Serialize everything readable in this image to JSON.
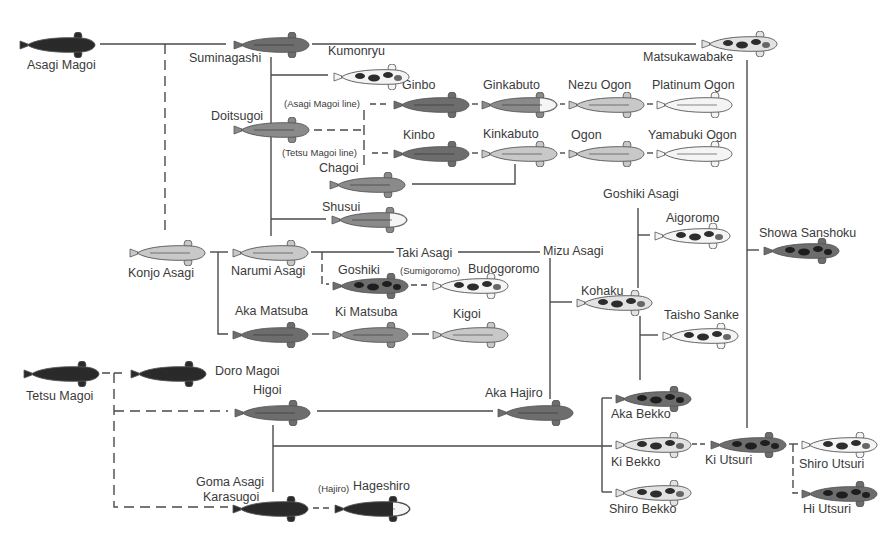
{
  "diagram": {
    "palette": {
      "line": "#444444",
      "dark": "#2a2a2a",
      "grey": "#6d6d6d",
      "mid": "#8a8a8a",
      "light": "#c8c8c8",
      "white": "#f4f4f4",
      "outline": "#555555"
    },
    "nodes": [
      {
        "id": "asagi_magoi",
        "label": "Asagi Magoi",
        "fish": {
          "x": 18,
          "y": 32,
          "style": "dark"
        },
        "label_pos": {
          "x": 27,
          "y": 58
        }
      },
      {
        "id": "suminagashi",
        "label": "Suminagashi",
        "fish": {
          "x": 232,
          "y": 32,
          "style": "grey"
        },
        "label_pos": {
          "x": 189,
          "y": 51
        }
      },
      {
        "id": "kumonryu",
        "label": "Kumonryu",
        "fish": {
          "x": 332,
          "y": 64,
          "style": "spotted"
        },
        "label_pos": {
          "x": 328,
          "y": 44
        }
      },
      {
        "id": "matsukawabake",
        "label": "Matsukawabake",
        "fish": {
          "x": 700,
          "y": 31,
          "style": "spotted-light"
        },
        "label_pos": {
          "x": 643,
          "y": 50
        }
      },
      {
        "id": "doitsugoi",
        "label": "Doitsugoi",
        "fish": {
          "x": 232,
          "y": 117,
          "style": "mid"
        },
        "label_pos": {
          "x": 211,
          "y": 109
        }
      },
      {
        "id": "ginbo",
        "label": "Ginbo",
        "fish": {
          "x": 392,
          "y": 92,
          "style": "grey"
        },
        "label_pos": {
          "x": 402,
          "y": 24
        }
      },
      {
        "id": "ginkabuto",
        "label": "Ginkabuto",
        "fish": {
          "x": 480,
          "y": 92,
          "style": "mid-whitehead"
        },
        "label_pos": {
          "x": 483,
          "y": 24
        }
      },
      {
        "id": "nezu_ogon",
        "label": "Nezu Ogon",
        "fish": {
          "x": 567,
          "y": 92,
          "style": "light"
        },
        "label_pos": {
          "x": 568,
          "y": 24
        }
      },
      {
        "id": "platinum_ogon",
        "label": "Platinum Ogon",
        "fish": {
          "x": 655,
          "y": 92,
          "style": "white"
        },
        "label_pos": {
          "x": 652,
          "y": 24
        }
      },
      {
        "id": "kinbo",
        "label": "Kinbo",
        "fish": {
          "x": 392,
          "y": 141,
          "style": "grey"
        },
        "label_pos": {
          "x": 403,
          "y": 73
        }
      },
      {
        "id": "kinkabuto",
        "label": "Kinkabuto",
        "fish": {
          "x": 480,
          "y": 141,
          "style": "light"
        },
        "label_pos": {
          "x": 483,
          "y": 73
        }
      },
      {
        "id": "ogon",
        "label": "Ogon",
        "fish": {
          "x": 567,
          "y": 141,
          "style": "light"
        },
        "label_pos": {
          "x": 571,
          "y": 73
        }
      },
      {
        "id": "yamabuki_ogon",
        "label": "Yamabuki Ogon",
        "fish": {
          "x": 655,
          "y": 141,
          "style": "white"
        },
        "label_pos": {
          "x": 648,
          "y": 73
        }
      },
      {
        "id": "chagoi",
        "label": "Chagoi",
        "fish": {
          "x": 328,
          "y": 172,
          "style": "mid"
        },
        "label_pos": {
          "x": 319,
          "y": 104
        }
      },
      {
        "id": "shusui",
        "label": "Shusui",
        "fish": {
          "x": 330,
          "y": 207,
          "style": "mid-whitehead"
        },
        "label_pos": {
          "x": 322,
          "y": 200
        }
      },
      {
        "id": "goshiki_asagi",
        "label": "Goshiki Asagi",
        "fish": null,
        "label_pos": {
          "x": 603,
          "y": 187
        }
      },
      {
        "id": "aigoromo",
        "label": "Aigoromo",
        "fish": {
          "x": 653,
          "y": 223,
          "style": "spotted"
        },
        "label_pos": {
          "x": 666,
          "y": 211
        }
      },
      {
        "id": "showa_sanshoku",
        "label": "Showa Sanshoku",
        "fish": {
          "x": 762,
          "y": 238,
          "style": "spotted-dark"
        },
        "label_pos": {
          "x": 759,
          "y": 226
        }
      },
      {
        "id": "konjo_asagi",
        "label": "Konjo Asagi",
        "fish": {
          "x": 128,
          "y": 240,
          "style": "light"
        },
        "label_pos": {
          "x": 128,
          "y": 266
        }
      },
      {
        "id": "narumi_asagi",
        "label": "Narumi Asagi",
        "fish": {
          "x": 231,
          "y": 240,
          "style": "light"
        },
        "label_pos": {
          "x": 231,
          "y": 264
        }
      },
      {
        "id": "taki_asagi",
        "label": "Taki Asagi",
        "fish": null,
        "label_pos": {
          "x": 396,
          "y": 249
        }
      },
      {
        "id": "mizu_asagi",
        "label": "Mizu Asagi",
        "fish": null,
        "label_pos": {
          "x": 543,
          "y": 244
        }
      },
      {
        "id": "goshiki",
        "label": "Goshiki",
        "fish": {
          "x": 331,
          "y": 273,
          "style": "spotted-dark"
        },
        "label_pos": {
          "x": 338,
          "y": 263
        }
      },
      {
        "id": "budogoromo",
        "label": "Budogoromo",
        "fish": {
          "x": 431,
          "y": 273,
          "style": "spotted"
        },
        "label_pos": {
          "x": 468,
          "y": 262
        },
        "prefix": "(Sumigoromo)"
      },
      {
        "id": "kohaku",
        "label": "Kohaku",
        "fish": {
          "x": 575,
          "y": 290,
          "style": "spotted-light"
        },
        "label_pos": {
          "x": 581,
          "y": 284
        }
      },
      {
        "id": "aka_matsuba",
        "label": "Aka Matsuba",
        "fish": {
          "x": 231,
          "y": 322,
          "style": "grey"
        },
        "label_pos": {
          "x": 235,
          "y": 304
        }
      },
      {
        "id": "ki_matsuba",
        "label": "Ki Matsuba",
        "fish": {
          "x": 331,
          "y": 322,
          "style": "mid"
        },
        "label_pos": {
          "x": 335,
          "y": 305
        }
      },
      {
        "id": "kigoi",
        "label": "Kigoi",
        "fish": {
          "x": 431,
          "y": 322,
          "style": "light"
        },
        "label_pos": {
          "x": 453,
          "y": 306
        }
      },
      {
        "id": "taisho_sanke",
        "label": "Taisho Sanke",
        "fish": {
          "x": 661,
          "y": 323,
          "style": "spotted"
        },
        "label_pos": {
          "x": 664,
          "y": 308
        }
      },
      {
        "id": "tetsu_magoi",
        "label": "Tetsu Magoi",
        "fish": {
          "x": 22,
          "y": 361,
          "style": "dark"
        },
        "label_pos": {
          "x": 26,
          "y": 389
        }
      },
      {
        "id": "doro_magoi",
        "label": "Doro Magoi",
        "fish": {
          "x": 129,
          "y": 361,
          "style": "dark"
        },
        "label_pos": {
          "x": 215,
          "y": 364
        }
      },
      {
        "id": "higoi",
        "label": "Higoi",
        "fish": {
          "x": 233,
          "y": 400,
          "style": "grey"
        },
        "label_pos": {
          "x": 253,
          "y": 383
        }
      },
      {
        "id": "aka_hajiro",
        "label": "Aka Hajiro",
        "fish": {
          "x": 496,
          "y": 400,
          "style": "grey"
        },
        "label_pos": {
          "x": 485,
          "y": 386
        }
      },
      {
        "id": "aka_bekko",
        "label": "Aka Bekko",
        "fish": {
          "x": 614,
          "y": 386,
          "style": "spotted-dark"
        },
        "label_pos": {
          "x": 611,
          "y": 407
        }
      },
      {
        "id": "ki_bekko",
        "label": "Ki Bekko",
        "fish": {
          "x": 614,
          "y": 432,
          "style": "spotted-light"
        },
        "label_pos": {
          "x": 611,
          "y": 455
        }
      },
      {
        "id": "ki_utsuri",
        "label": "Ki Utsuri",
        "fish": {
          "x": 709,
          "y": 432,
          "style": "spotted-dark"
        },
        "label_pos": {
          "x": 705,
          "y": 453
        }
      },
      {
        "id": "shiro_utsuri",
        "label": "Shiro Utsuri",
        "fish": {
          "x": 800,
          "y": 432,
          "style": "spotted"
        },
        "label_pos": {
          "x": 799,
          "y": 457
        }
      },
      {
        "id": "shiro_bekko",
        "label": "Shiro Bekko",
        "fish": {
          "x": 614,
          "y": 480,
          "style": "spotted-light"
        },
        "label_pos": {
          "x": 609,
          "y": 502
        }
      },
      {
        "id": "hi_utsuri",
        "label": "Hi Utsuri",
        "fish": {
          "x": 800,
          "y": 481,
          "style": "spotted-dark"
        },
        "label_pos": {
          "x": 803,
          "y": 502
        }
      },
      {
        "id": "goma_asagi_karasugoi",
        "label": "Goma Asagi",
        "label2": "Karasugoi",
        "fish": {
          "x": 231,
          "y": 496,
          "style": "dark"
        },
        "label_pos": {
          "x": 196,
          "y": 475
        }
      },
      {
        "id": "hageshiro",
        "label": "Hageshiro",
        "fish": {
          "x": 333,
          "y": 496,
          "style": "dark-whitehead"
        },
        "label_pos": {
          "x": 351,
          "y": 479
        },
        "prefix": "(Hajiro)"
      }
    ],
    "annotations": [
      {
        "text": "(Asagi Magoi line)",
        "x": 284,
        "y": 97
      },
      {
        "text": "(Tetsu Magoi line)",
        "x": 282,
        "y": 146
      }
    ],
    "edges": [
      {
        "from": "asagi_magoi",
        "to": "suminagashi",
        "type": "solid"
      },
      {
        "from": "suminagashi",
        "to": "matsukawabake",
        "type": "solid"
      },
      {
        "from": "asagi_magoi",
        "to": "konjo_asagi",
        "type": "dashed"
      },
      {
        "from": "suminagashi",
        "to": "kumonryu",
        "type": "solid"
      },
      {
        "from": "suminagashi",
        "to": "doitsugoi",
        "type": "solid"
      },
      {
        "from": "suminagashi",
        "to": "shusui",
        "type": "solid"
      },
      {
        "from": "suminagashi",
        "to": "narumi_asagi",
        "type": "solid"
      },
      {
        "from": "doitsugoi",
        "to": "ginbo",
        "type": "dashed",
        "note": "Asagi Magoi line"
      },
      {
        "from": "doitsugoi",
        "to": "kinbo",
        "type": "dashed",
        "note": "Tetsu Magoi line"
      },
      {
        "from": "ginbo",
        "to": "ginkabuto",
        "type": "dashed"
      },
      {
        "from": "ginkabuto",
        "to": "nezu_ogon",
        "type": "dashed"
      },
      {
        "from": "nezu_ogon",
        "to": "platinum_ogon",
        "type": "dashed"
      },
      {
        "from": "kinbo",
        "to": "kinkabuto",
        "type": "dashed"
      },
      {
        "from": "kinkabuto",
        "to": "ogon",
        "type": "dashed"
      },
      {
        "from": "ogon",
        "to": "yamabuki_ogon",
        "type": "dashed"
      },
      {
        "from": "chagoi",
        "to": "kinkabuto",
        "type": "solid"
      },
      {
        "from": "konjo_asagi",
        "to": "narumi_asagi",
        "type": "solid"
      },
      {
        "from": "konjo_asagi",
        "to": "aka_matsuba",
        "type": "solid"
      },
      {
        "from": "narumi_asagi",
        "to": "taki_asagi",
        "type": "solid"
      },
      {
        "from": "taki_asagi",
        "to": "mizu_asagi",
        "type": "solid"
      },
      {
        "from": "narumi_asagi",
        "to": "goshiki",
        "type": "dashed"
      },
      {
        "from": "goshiki",
        "to": "budogoromo",
        "type": "dashed"
      },
      {
        "from": "aka_matsuba",
        "to": "ki_matsuba",
        "type": "dashed"
      },
      {
        "from": "ki_matsuba",
        "to": "kigoi",
        "type": "dashed"
      },
      {
        "from": "mizu_asagi",
        "to": "kohaku",
        "type": "solid"
      },
      {
        "from": "mizu_asagi",
        "to": "aka_hajiro",
        "type": "solid"
      },
      {
        "from": "goshiki_asagi",
        "to": "aigoromo",
        "type": "solid"
      },
      {
        "from": "kohaku",
        "to": "goshiki_asagi",
        "type": "solid"
      },
      {
        "from": "kohaku",
        "to": "taisho_sanke",
        "type": "solid"
      },
      {
        "from": "kohaku",
        "to": "aka_bekko",
        "type": "solid"
      },
      {
        "from": "matsukawabake",
        "to": "showa_sanshoku",
        "type": "solid"
      },
      {
        "from": "matsukawabake",
        "to": "ki_utsuri",
        "type": "solid"
      },
      {
        "from": "tetsu_magoi",
        "to": "doro_magoi",
        "type": "dashed"
      },
      {
        "from": "tetsu_magoi",
        "to": "higoi",
        "type": "dashed"
      },
      {
        "from": "tetsu_magoi",
        "to": "goma_asagi_karasugoi",
        "type": "dashed"
      },
      {
        "from": "higoi",
        "to": "aka_hajiro",
        "type": "solid"
      },
      {
        "from": "higoi",
        "to": "goma_asagi_karasugoi",
        "type": "solid"
      },
      {
        "from": "higoi",
        "to": "ki_bekko",
        "type": "solid"
      },
      {
        "from": "aka_bekko",
        "to": "ki_bekko",
        "type": "solid"
      },
      {
        "from": "ki_bekko",
        "to": "shiro_bekko",
        "type": "solid"
      },
      {
        "from": "ki_bekko",
        "to": "ki_utsuri",
        "type": "dashed"
      },
      {
        "from": "ki_utsuri",
        "to": "shiro_utsuri",
        "type": "dashed"
      },
      {
        "from": "ki_utsuri",
        "to": "hi_utsuri",
        "type": "dashed"
      },
      {
        "from": "goma_asagi_karasugoi",
        "to": "hageshiro",
        "type": "dashed"
      }
    ]
  }
}
